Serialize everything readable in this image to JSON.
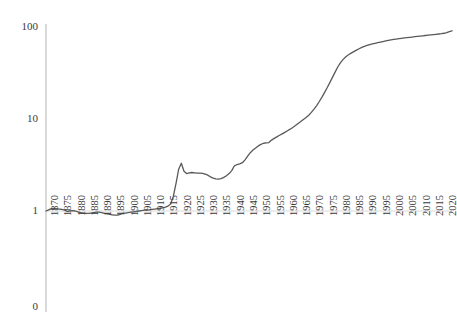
{
  "chart_data": {
    "type": "line",
    "title": "",
    "subtitle": "",
    "xlabel": "",
    "ylabel": "",
    "yscale": "log",
    "ylim": [
      1,
      100
    ],
    "ytick_labels": [
      "100",
      "10",
      "1",
      "0"
    ],
    "ytick_values": [
      100,
      10,
      1,
      0
    ],
    "xlim": [
      1870,
      2023
    ],
    "grid": false,
    "legend": null,
    "legend_position": "none",
    "line_color": "#595959",
    "axis_color": "#d9d9d9",
    "text_color": "#3a3a3a",
    "categories": [
      "1870",
      "1875",
      "1880",
      "1885",
      "1890",
      "1895",
      "1900",
      "1905",
      "1910",
      "1915",
      "1920",
      "1925",
      "1930",
      "1935",
      "1940",
      "1945",
      "1950",
      "1955",
      "1960",
      "1965",
      "1970",
      "1975",
      "1980",
      "1985",
      "1990",
      "1995",
      "2000",
      "2005",
      "2010",
      "2015",
      "2020"
    ],
    "series": [
      {
        "name": "value",
        "x": [
          1870,
          1871,
          1872,
          1873,
          1874,
          1875,
          1876,
          1877,
          1878,
          1879,
          1880,
          1881,
          1882,
          1883,
          1884,
          1885,
          1886,
          1887,
          1888,
          1889,
          1890,
          1891,
          1892,
          1893,
          1894,
          1895,
          1896,
          1897,
          1898,
          1899,
          1900,
          1901,
          1902,
          1903,
          1904,
          1905,
          1906,
          1907,
          1908,
          1909,
          1910,
          1911,
          1912,
          1913,
          1914,
          1915,
          1916,
          1917,
          1918,
          1919,
          1920,
          1921,
          1922,
          1923,
          1924,
          1925,
          1926,
          1927,
          1928,
          1929,
          1930,
          1931,
          1932,
          1933,
          1934,
          1935,
          1936,
          1937,
          1938,
          1939,
          1940,
          1941,
          1942,
          1943,
          1944,
          1945,
          1946,
          1947,
          1948,
          1949,
          1950,
          1951,
          1952,
          1953,
          1954,
          1955,
          1956,
          1957,
          1958,
          1959,
          1960,
          1961,
          1962,
          1963,
          1964,
          1965,
          1966,
          1967,
          1968,
          1969,
          1970,
          1971,
          1972,
          1973,
          1974,
          1975,
          1976,
          1977,
          1978,
          1979,
          1980,
          1981,
          1982,
          1983,
          1984,
          1985,
          1986,
          1987,
          1988,
          1989,
          1990,
          1991,
          1992,
          1993,
          1994,
          1995,
          1996,
          1997,
          1998,
          1999,
          2000,
          2001,
          2002,
          2003,
          2004,
          2005,
          2006,
          2007,
          2008,
          2009,
          2010,
          2011,
          2012,
          2013,
          2014,
          2015,
          2016,
          2017,
          2018,
          2019,
          2020,
          2021,
          2022,
          2023
        ],
        "values": [
          1.0,
          1.03,
          1.06,
          1.07,
          1.06,
          1.05,
          1.04,
          1.02,
          0.99,
          1.0,
          1.01,
          1.0,
          0.98,
          0.96,
          0.95,
          0.94,
          0.94,
          0.95,
          0.96,
          0.97,
          0.97,
          0.96,
          0.94,
          0.93,
          0.92,
          0.91,
          0.9,
          0.9,
          0.92,
          0.94,
          0.95,
          0.96,
          0.97,
          0.98,
          0.99,
          1.0,
          1.01,
          1.02,
          1.02,
          1.03,
          1.04,
          1.05,
          1.06,
          1.07,
          1.08,
          1.1,
          1.13,
          1.2,
          1.45,
          2.0,
          2.85,
          3.3,
          2.7,
          2.55,
          2.6,
          2.62,
          2.6,
          2.58,
          2.58,
          2.57,
          2.52,
          2.45,
          2.35,
          2.28,
          2.24,
          2.22,
          2.25,
          2.32,
          2.42,
          2.55,
          2.75,
          3.1,
          3.2,
          3.25,
          3.35,
          3.6,
          3.95,
          4.3,
          4.6,
          4.85,
          5.1,
          5.3,
          5.45,
          5.5,
          5.55,
          5.9,
          6.15,
          6.4,
          6.65,
          6.9,
          7.15,
          7.45,
          7.75,
          8.1,
          8.5,
          8.95,
          9.4,
          9.9,
          10.4,
          11.0,
          11.8,
          12.8,
          14.0,
          15.5,
          17.3,
          19.5,
          22.0,
          25.0,
          28.5,
          32.5,
          37.0,
          41.0,
          44.5,
          47.5,
          50.0,
          52.0,
          54.0,
          56.0,
          58.0,
          60.0,
          61.5,
          63.0,
          64.5,
          65.5,
          66.5,
          67.5,
          68.5,
          69.5,
          70.5,
          71.5,
          72.5,
          73.2,
          73.9,
          74.6,
          75.3,
          76.0,
          76.6,
          77.2,
          77.8,
          78.4,
          79.0,
          79.6,
          80.2,
          80.8,
          81.4,
          82.0,
          82.6,
          83.2,
          83.9,
          84.6,
          85.5,
          87.0,
          89.0,
          91.0
        ]
      }
    ]
  }
}
